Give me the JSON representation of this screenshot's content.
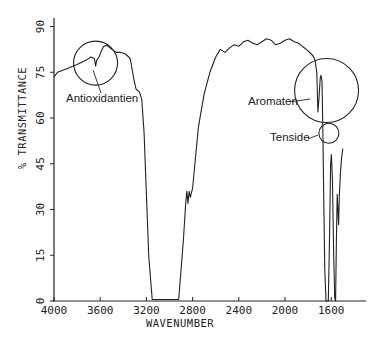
{
  "chart_data": {
    "type": "line",
    "title": "",
    "xlabel": "WAVENUMBER",
    "ylabel": "% TRANSMITTANCE",
    "xlim": [
      4000,
      1370
    ],
    "ylim": [
      0,
      90
    ],
    "x_reversed": true,
    "grid": false,
    "legend": null,
    "x_ticks": [
      4000,
      3600,
      3200,
      2800,
      2400,
      2000,
      1600
    ],
    "x_tick_labels": [
      "4000",
      "3600",
      "3200",
      "2800",
      "2400",
      "2000",
      "1600"
    ],
    "y_ticks": [
      0,
      15,
      30,
      45,
      60,
      75,
      90
    ],
    "y_tick_labels": [
      "0",
      "15",
      "30",
      "45",
      "60",
      "75",
      "90"
    ],
    "series": [
      {
        "name": "IR spectrum",
        "color": "#222222",
        "points": [
          [
            4000,
            73.5
          ],
          [
            3970,
            75
          ],
          [
            3900,
            76
          ],
          [
            3800,
            77.5
          ],
          [
            3720,
            79
          ],
          [
            3680,
            80
          ],
          [
            3650,
            79.5
          ],
          [
            3640,
            77
          ],
          [
            3630,
            79
          ],
          [
            3610,
            80
          ],
          [
            3590,
            82
          ],
          [
            3570,
            83.5
          ],
          [
            3540,
            83.8
          ],
          [
            3500,
            82.5
          ],
          [
            3460,
            81.5
          ],
          [
            3420,
            81.5
          ],
          [
            3380,
            81
          ],
          [
            3340,
            79.5
          ],
          [
            3310,
            73
          ],
          [
            3290,
            69.5
          ],
          [
            3260,
            68.5
          ],
          [
            3240,
            66
          ],
          [
            3220,
            55
          ],
          [
            3200,
            35
          ],
          [
            3180,
            15
          ],
          [
            3150,
            0.5
          ],
          [
            2920,
            0.5
          ],
          [
            2880,
            20
          ],
          [
            2860,
            32
          ],
          [
            2850,
            36
          ],
          [
            2840,
            32
          ],
          [
            2830,
            36
          ],
          [
            2820,
            34
          ],
          [
            2800,
            37
          ],
          [
            2780,
            45
          ],
          [
            2750,
            57
          ],
          [
            2700,
            68
          ],
          [
            2650,
            75
          ],
          [
            2600,
            80
          ],
          [
            2560,
            82.5
          ],
          [
            2520,
            81.5
          ],
          [
            2480,
            83
          ],
          [
            2440,
            84
          ],
          [
            2400,
            83.5
          ],
          [
            2360,
            85
          ],
          [
            2320,
            85.5
          ],
          [
            2280,
            84.5
          ],
          [
            2240,
            84
          ],
          [
            2200,
            85
          ],
          [
            2160,
            86
          ],
          [
            2120,
            85.5
          ],
          [
            2080,
            84
          ],
          [
            2040,
            84.5
          ],
          [
            2000,
            85.5
          ],
          [
            1960,
            86
          ],
          [
            1920,
            85
          ],
          [
            1880,
            84.5
          ],
          [
            1850,
            83.5
          ],
          [
            1800,
            82
          ],
          [
            1760,
            80.5
          ],
          [
            1740,
            79
          ],
          [
            1725,
            75
          ],
          [
            1715,
            62
          ],
          [
            1705,
            67
          ],
          [
            1695,
            73
          ],
          [
            1688,
            74
          ],
          [
            1680,
            72
          ],
          [
            1672,
            55
          ],
          [
            1665,
            35
          ],
          [
            1655,
            10
          ],
          [
            1645,
            0
          ],
          [
            1625,
            0
          ],
          [
            1615,
            20
          ],
          [
            1605,
            45
          ],
          [
            1598,
            48
          ],
          [
            1590,
            40
          ],
          [
            1578,
            15
          ],
          [
            1570,
            1
          ],
          [
            1562,
            0
          ],
          [
            1555,
            20
          ],
          [
            1548,
            35
          ],
          [
            1542,
            30
          ],
          [
            1536,
            25
          ],
          [
            1530,
            34
          ],
          [
            1520,
            42
          ],
          [
            1510,
            47
          ],
          [
            1500,
            50
          ]
        ]
      }
    ],
    "annotations": [
      {
        "label": "Antioxidantien",
        "circle_center_wavenumber": 3640,
        "circle_center_T": 78,
        "circle_radius_px": 22
      },
      {
        "label": "Aromaten",
        "circle_center_wavenumber": 1640,
        "circle_center_T": 69,
        "circle_radius_px": 32
      },
      {
        "label": "Tenside",
        "circle_center_wavenumber": 1620,
        "circle_center_T": 55,
        "circle_radius_px": 10
      }
    ]
  },
  "axes": {
    "xlabel": "WAVENUMBER",
    "ylabel": "% TRANSMITTANCE"
  }
}
